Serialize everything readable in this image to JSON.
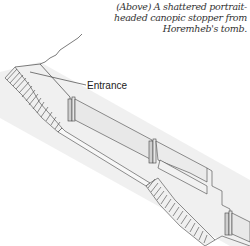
{
  "caption": {
    "lines": [
      "(Above) A shattered portrait-",
      "headed canopic stopper from",
      "Horemheb's tomb."
    ]
  },
  "diagram": {
    "labels": [
      {
        "text": "Entrance"
      }
    ],
    "colors": {
      "line": "#333333",
      "wall_fill": "#e8e8e8",
      "shadow": "#d9d9d9",
      "step_fill": "#f4f4f4"
    }
  }
}
